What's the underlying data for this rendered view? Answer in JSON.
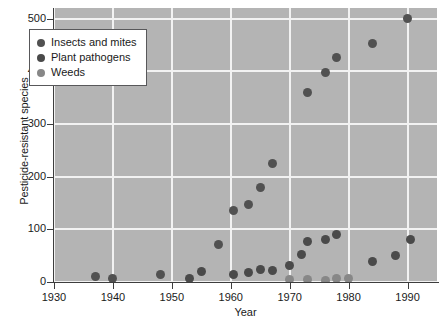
{
  "chart_data": {
    "type": "scatter",
    "title": "",
    "xlabel": "Year",
    "ylabel": "Pesticide-resistant species",
    "xlim": [
      1930,
      1995
    ],
    "ylim": [
      0,
      520
    ],
    "xticks": [
      1930,
      1940,
      1950,
      1960,
      1970,
      1980,
      1990
    ],
    "yticks": [
      0,
      100,
      200,
      300,
      400,
      500
    ],
    "grid": true,
    "legend_position": "upper-left",
    "colors": {
      "insects": "#515151",
      "pathogens": "#4a4a4a",
      "weeds": "#878787",
      "plot_background": "#b4b4b4",
      "gridline": "#f2f2f2",
      "axis": "#3d3d3d"
    },
    "series": [
      {
        "name": "Insects and mites",
        "color": "#515151",
        "points": [
          [
            1937,
            10
          ],
          [
            1940,
            7
          ],
          [
            1948,
            14
          ],
          [
            1958,
            72
          ],
          [
            1960.5,
            135
          ],
          [
            1963,
            148
          ],
          [
            1965,
            180
          ],
          [
            1967,
            225
          ],
          [
            1973,
            360
          ],
          [
            1976,
            398
          ],
          [
            1978,
            427
          ],
          [
            1984,
            452
          ],
          [
            1990,
            500
          ]
        ]
      },
      {
        "name": "Plant pathogens",
        "color": "#4a4a4a",
        "points": [
          [
            1953,
            7
          ],
          [
            1955,
            20
          ],
          [
            1960.5,
            14
          ],
          [
            1963,
            18
          ],
          [
            1965,
            23
          ],
          [
            1967,
            22
          ],
          [
            1970,
            32
          ],
          [
            1972,
            52
          ],
          [
            1973,
            76
          ],
          [
            1976,
            81
          ],
          [
            1978,
            91
          ],
          [
            1984,
            39
          ],
          [
            1988,
            51
          ],
          [
            1990.5,
            80
          ]
        ]
      },
      {
        "name": "Weeds",
        "color": "#878787",
        "points": [
          [
            1970,
            4
          ],
          [
            1973,
            5
          ],
          [
            1976,
            2
          ],
          [
            1978,
            7
          ],
          [
            1980,
            7
          ]
        ]
      }
    ]
  },
  "legend": {
    "items": [
      {
        "label": "Insects and mites",
        "color": "#515151"
      },
      {
        "label": "Plant pathogens",
        "color": "#4a4a4a"
      },
      {
        "label": "Weeds",
        "color": "#878787"
      }
    ]
  }
}
